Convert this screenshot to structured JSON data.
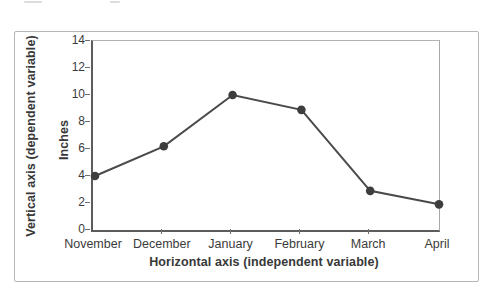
{
  "chart_data": {
    "type": "line",
    "categories": [
      "November",
      "December",
      "January",
      "February",
      "March",
      "April"
    ],
    "values": [
      4.0,
      6.2,
      10.0,
      8.9,
      2.9,
      1.9
    ],
    "title": "",
    "xlabel": "Horizontal axis (independent variable)",
    "ylabel": "Vertical axis (dependent variable)",
    "ylabel_units": "Inches",
    "ylim": [
      0,
      14
    ],
    "yticks": [
      14,
      12,
      10,
      8,
      6,
      4,
      2,
      0
    ],
    "grid": false,
    "legend": "none",
    "marker": "filled-circle",
    "line_color": "#4a4a4a",
    "marker_color": "#3d3d3d",
    "axis_color": "#5c5c5c",
    "frame_color": "#b5b5b5"
  }
}
